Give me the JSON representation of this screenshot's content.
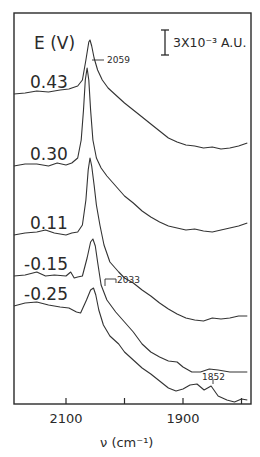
{
  "chart_data": {
    "type": "line",
    "title": "",
    "xlabel": "ν (cm⁻¹)",
    "ylabel": "",
    "xlim": [
      2189,
      1785
    ],
    "x_reversed": true,
    "x_ticks": [
      2100,
      2000,
      1900,
      1800
    ],
    "x_tick_labels": [
      "2100",
      "",
      "1900",
      ""
    ],
    "grid": false,
    "legend_header": "E (V)",
    "scale_bar": "3X10⁻³ A.U.",
    "annotations": [
      {
        "text": "2059",
        "x": 2059,
        "series": "0.43"
      },
      {
        "text": "2033",
        "x": 2033,
        "series": "-0.25"
      },
      {
        "text": "1852",
        "x": 1852,
        "series": "-0.25"
      }
    ],
    "series": [
      {
        "name": "0.43",
        "label_y": 40,
        "points": [
          [
            2189,
            94
          ],
          [
            2170,
            93
          ],
          [
            2150,
            91
          ],
          [
            2130,
            92
          ],
          [
            2110,
            90
          ],
          [
            2095,
            89
          ],
          [
            2080,
            86
          ],
          [
            2072,
            80
          ],
          [
            2066,
            60
          ],
          [
            2061,
            42
          ],
          [
            2059,
            40
          ],
          [
            2056,
            46
          ],
          [
            2052,
            58
          ],
          [
            2046,
            70
          ],
          [
            2038,
            80
          ],
          [
            2028,
            88
          ],
          [
            2015,
            95
          ],
          [
            2000,
            103
          ],
          [
            1985,
            110
          ],
          [
            1970,
            117
          ],
          [
            1955,
            124
          ],
          [
            1940,
            131
          ],
          [
            1925,
            138
          ],
          [
            1910,
            142
          ],
          [
            1895,
            145
          ],
          [
            1880,
            146
          ],
          [
            1865,
            148
          ],
          [
            1850,
            147
          ],
          [
            1835,
            149
          ],
          [
            1820,
            148
          ],
          [
            1805,
            146
          ],
          [
            1790,
            143
          ]
        ]
      },
      {
        "name": "0.30",
        "label_y": 26,
        "points": [
          [
            2189,
            166
          ],
          [
            2170,
            164
          ],
          [
            2150,
            164
          ],
          [
            2130,
            166
          ],
          [
            2115,
            163
          ],
          [
            2100,
            165
          ],
          [
            2090,
            163
          ],
          [
            2080,
            158
          ],
          [
            2074,
            140
          ],
          [
            2070,
            110
          ],
          [
            2067,
            80
          ],
          [
            2064,
            68
          ],
          [
            2061,
            80
          ],
          [
            2058,
            110
          ],
          [
            2054,
            140
          ],
          [
            2048,
            158
          ],
          [
            2040,
            168
          ],
          [
            2030,
            176
          ],
          [
            2015,
            186
          ],
          [
            2000,
            196
          ],
          [
            1985,
            203
          ],
          [
            1970,
            211
          ],
          [
            1955,
            217
          ],
          [
            1940,
            222
          ],
          [
            1925,
            226
          ],
          [
            1910,
            228
          ],
          [
            1895,
            230
          ],
          [
            1880,
            229
          ],
          [
            1865,
            231
          ],
          [
            1850,
            232
          ],
          [
            1835,
            230
          ],
          [
            1820,
            228
          ],
          [
            1805,
            226
          ],
          [
            1790,
            223
          ]
        ]
      },
      {
        "name": "0.11",
        "label_y": 22,
        "points": [
          [
            2189,
            235
          ],
          [
            2170,
            233
          ],
          [
            2150,
            232
          ],
          [
            2135,
            230
          ],
          [
            2120,
            233
          ],
          [
            2100,
            235
          ],
          [
            2090,
            233
          ],
          [
            2080,
            232
          ],
          [
            2072,
            225
          ],
          [
            2066,
            200
          ],
          [
            2062,
            170
          ],
          [
            2059,
            158
          ],
          [
            2056,
            166
          ],
          [
            2052,
            185
          ],
          [
            2048,
            205
          ],
          [
            2042,
            225
          ],
          [
            2035,
            245
          ],
          [
            2025,
            262
          ],
          [
            2010,
            272
          ],
          [
            2000,
            278
          ],
          [
            1985,
            283
          ],
          [
            1970,
            290
          ],
          [
            1955,
            296
          ],
          [
            1940,
            303
          ],
          [
            1925,
            309
          ],
          [
            1910,
            314
          ],
          [
            1895,
            318
          ],
          [
            1880,
            320
          ],
          [
            1865,
            321
          ],
          [
            1850,
            318
          ],
          [
            1835,
            319
          ],
          [
            1820,
            318
          ],
          [
            1805,
            316
          ],
          [
            1790,
            316
          ]
        ]
      },
      {
        "name": "-0.15",
        "label_y": 20,
        "points": [
          [
            2189,
            276
          ],
          [
            2170,
            275
          ],
          [
            2150,
            272
          ],
          [
            2135,
            276
          ],
          [
            2120,
            275
          ],
          [
            2100,
            276
          ],
          [
            2092,
            272
          ],
          [
            2086,
            278
          ],
          [
            2080,
            277
          ],
          [
            2072,
            276
          ],
          [
            2064,
            258
          ],
          [
            2058,
            242
          ],
          [
            2054,
            239
          ],
          [
            2050,
            246
          ],
          [
            2046,
            262
          ],
          [
            2040,
            285
          ],
          [
            2030,
            300
          ],
          [
            2015,
            312
          ],
          [
            2000,
            322
          ],
          [
            1985,
            332
          ],
          [
            1970,
            344
          ],
          [
            1955,
            352
          ],
          [
            1940,
            357
          ],
          [
            1925,
            361
          ],
          [
            1910,
            362
          ],
          [
            1900,
            367
          ],
          [
            1885,
            372
          ],
          [
            1870,
            372
          ],
          [
            1855,
            369
          ],
          [
            1840,
            370
          ],
          [
            1820,
            372
          ],
          [
            1805,
            372
          ],
          [
            1790,
            372
          ]
        ]
      },
      {
        "name": "-0.25",
        "label_y": 18,
        "points": [
          [
            2189,
            306
          ],
          [
            2170,
            303
          ],
          [
            2150,
            302
          ],
          [
            2130,
            305
          ],
          [
            2110,
            307
          ],
          [
            2095,
            308
          ],
          [
            2082,
            312
          ],
          [
            2075,
            313
          ],
          [
            2065,
            300
          ],
          [
            2058,
            290
          ],
          [
            2053,
            288
          ],
          [
            2049,
            295
          ],
          [
            2044,
            310
          ],
          [
            2036,
            325
          ],
          [
            2025,
            336
          ],
          [
            2010,
            344
          ],
          [
            2000,
            352
          ],
          [
            1985,
            360
          ],
          [
            1970,
            368
          ],
          [
            1955,
            374
          ],
          [
            1940,
            381
          ],
          [
            1925,
            388
          ],
          [
            1912,
            391
          ],
          [
            1900,
            389
          ],
          [
            1888,
            385
          ],
          [
            1876,
            384
          ],
          [
            1864,
            390
          ],
          [
            1852,
            386
          ],
          [
            1840,
            396
          ],
          [
            1825,
            400
          ],
          [
            1812,
            402
          ],
          [
            1800,
            399
          ],
          [
            1790,
            400
          ]
        ]
      }
    ]
  }
}
